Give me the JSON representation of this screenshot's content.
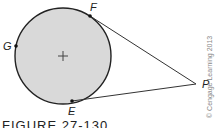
{
  "figure": {
    "points": {
      "F": {
        "label": "F",
        "x": 90,
        "y": 16
      },
      "G": {
        "label": "G",
        "x": 16,
        "y": 46
      },
      "E": {
        "label": "E",
        "x": 72,
        "y": 101
      },
      "P": {
        "label": "P",
        "x": 196,
        "y": 84
      }
    },
    "circle": {
      "cx": 63,
      "cy": 56,
      "r": 48,
      "fill": "#d9d9d9",
      "stroke": "#222222"
    },
    "copyright": "© Cengage Learning 2013",
    "caption": "FIGURE 27-130"
  }
}
